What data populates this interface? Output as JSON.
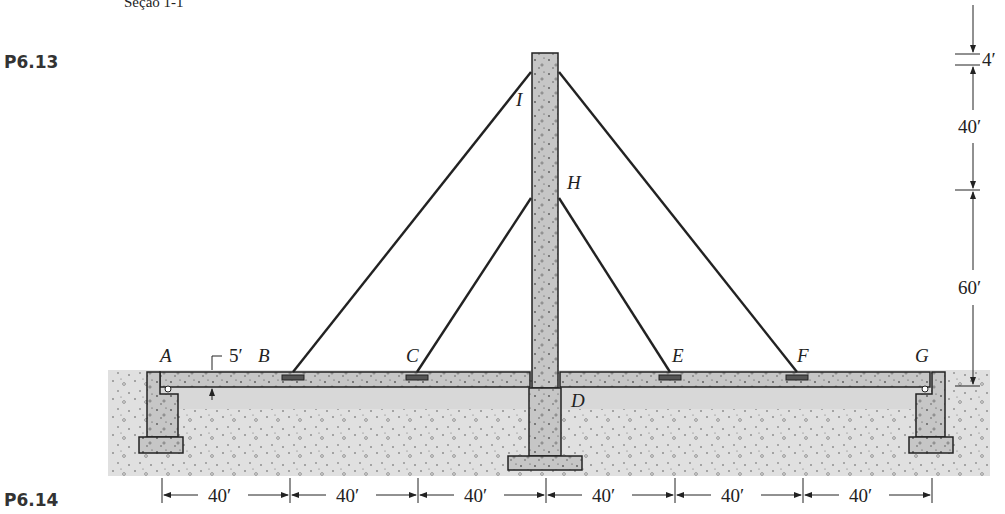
{
  "caption": "Seção 1-1",
  "problems": {
    "top": "P6.13",
    "bottom": "P6.14"
  },
  "nodes": {
    "A": "A",
    "B": "B",
    "C": "C",
    "D": "D",
    "E": "E",
    "F": "F",
    "G": "G",
    "H": "H",
    "I": "I"
  },
  "dimensions": {
    "deck_thickness": "5′",
    "vertical": [
      "4′",
      "40′",
      "60′"
    ],
    "horizontal": [
      "40′",
      "40′",
      "40′",
      "40′",
      "40′",
      "40′"
    ]
  },
  "colors": {
    "concrete": "#c9c9c9",
    "soil": "#e2e2e2",
    "line": "#222222"
  }
}
